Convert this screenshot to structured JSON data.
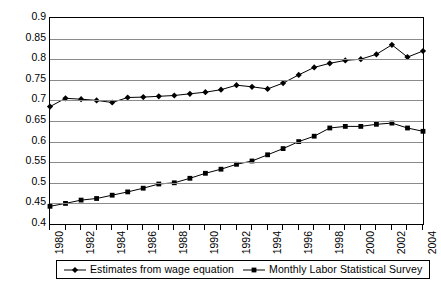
{
  "chart_data": {
    "type": "line",
    "title": "",
    "xlabel": "",
    "ylabel": "",
    "xlim": [
      1980,
      2004
    ],
    "ylim": [
      0.4,
      0.9
    ],
    "y_ticks": [
      0.4,
      0.45,
      0.5,
      0.55,
      0.6,
      0.65,
      0.7,
      0.75,
      0.8,
      0.85,
      0.9
    ],
    "y_tick_labels": [
      "0.4",
      "0.45",
      "0.5",
      "0.55",
      "0.6",
      "0.65",
      "0.7",
      "0.75",
      "0.8",
      "0.85",
      "0.9"
    ],
    "x": [
      1980,
      1981,
      1982,
      1983,
      1984,
      1985,
      1986,
      1987,
      1988,
      1989,
      1990,
      1991,
      1992,
      1993,
      1994,
      1995,
      1996,
      1997,
      1998,
      1999,
      2000,
      2001,
      2002,
      2003,
      2004
    ],
    "x_tick_labels": [
      "1980",
      "1982",
      "1984",
      "1986",
      "1988",
      "1990",
      "1992",
      "1994",
      "1996",
      "1998",
      "2000",
      "2002",
      "2004"
    ],
    "grid": true,
    "legend_position": "bottom",
    "series": [
      {
        "name": "Estimates from wage equation",
        "marker": "diamond",
        "color": "#000000",
        "values": [
          0.685,
          0.705,
          0.703,
          0.7,
          0.695,
          0.707,
          0.708,
          0.71,
          0.712,
          0.716,
          0.72,
          0.726,
          0.737,
          0.733,
          0.728,
          0.742,
          0.762,
          0.78,
          0.79,
          0.797,
          0.8,
          0.812,
          0.835,
          0.805,
          0.82
        ]
      },
      {
        "name": "Monthly Labor Statistical Survey",
        "marker": "square",
        "color": "#000000",
        "values": [
          0.443,
          0.45,
          0.458,
          0.462,
          0.47,
          0.478,
          0.487,
          0.497,
          0.5,
          0.511,
          0.523,
          0.533,
          0.545,
          0.553,
          0.568,
          0.583,
          0.6,
          0.613,
          0.633,
          0.637,
          0.637,
          0.642,
          0.645,
          0.633,
          0.625
        ]
      }
    ]
  },
  "legend": {
    "items": [
      {
        "label": "Estimates from wage equation",
        "marker": "diamond"
      },
      {
        "label": "Monthly Labor Statistical Survey",
        "marker": "square"
      }
    ]
  }
}
